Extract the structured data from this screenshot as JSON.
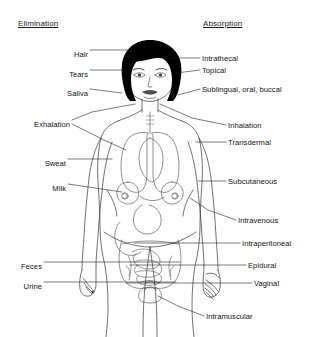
{
  "figure": {
    "title_left": "Elimination",
    "title_right": "Absorption",
    "colors": {
      "background": "#ffffff",
      "outline": "#333333",
      "hair": "#000000",
      "text": "#111111"
    }
  },
  "elimination": {
    "header": "Elimination",
    "routes": [
      {
        "label": "Hair",
        "x": 60,
        "y": 50,
        "width": 28
      },
      {
        "label": "Tears",
        "x": 56,
        "y": 70,
        "width": 32
      },
      {
        "label": "Saliva",
        "x": 55,
        "y": 89,
        "width": 33
      },
      {
        "label": "Exhalation",
        "x": 18,
        "y": 120,
        "width": 52
      },
      {
        "label": "Sweat",
        "x": 33,
        "y": 159,
        "width": 33
      },
      {
        "label": "Milk",
        "x": 41,
        "y": 184,
        "width": 25
      },
      {
        "label": "Feces",
        "x": 12,
        "y": 262,
        "width": 30
      },
      {
        "label": "Urine",
        "x": 14,
        "y": 282,
        "width": 28
      }
    ]
  },
  "absorption": {
    "header": "Absorption",
    "routes": [
      {
        "label": "Intrathecal",
        "x": 202,
        "y": 58
      },
      {
        "label": "Topical",
        "x": 202,
        "y": 70
      },
      {
        "label": "Sublingual, oral, buccal",
        "x": 202,
        "y": 89
      },
      {
        "label": "Inhalation",
        "x": 228,
        "y": 125
      },
      {
        "label": "Transdermal",
        "x": 228,
        "y": 142
      },
      {
        "label": "Subcutaneous",
        "x": 228,
        "y": 181
      },
      {
        "label": "Intravenous",
        "x": 238,
        "y": 220
      },
      {
        "label": "Intraperitoneal",
        "x": 242,
        "y": 243
      },
      {
        "label": "Epidural",
        "x": 248,
        "y": 265
      },
      {
        "label": "Vaginal",
        "x": 254,
        "y": 283
      },
      {
        "label": "Intramuscular",
        "x": 206,
        "y": 316
      }
    ]
  }
}
